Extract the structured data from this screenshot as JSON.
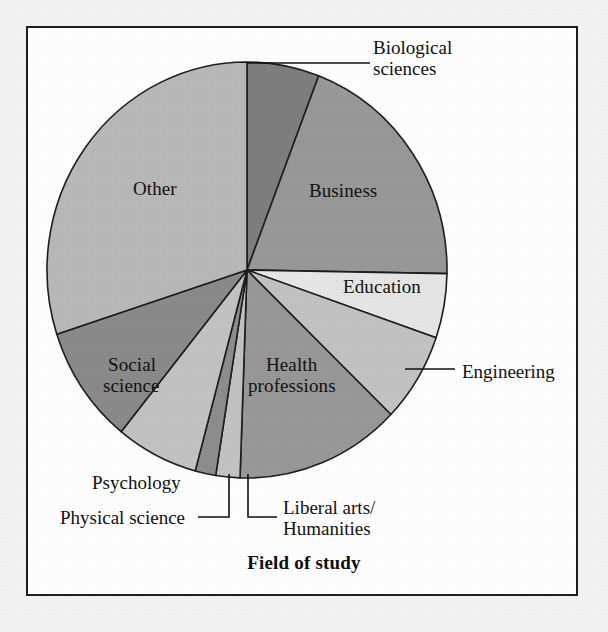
{
  "figure": {
    "title": "Field of study",
    "frame": {
      "border_color": "#1d1d1d",
      "background": "#ffffff"
    },
    "page_background": "#f3f3f1"
  },
  "chart_data": {
    "type": "pie",
    "title": "Field of study",
    "xlabel": "",
    "ylabel": "",
    "legend_position": "none",
    "grid": false,
    "start_angle_deg": 0,
    "direction": "clockwise",
    "center": {
      "x": 247,
      "y": 270
    },
    "radius": {
      "rx": 200,
      "ry": 208
    },
    "categories": [
      "Biological sciences",
      "Business",
      "Education",
      "Engineering",
      "Health professions",
      "Liberal arts/ Humanities",
      "Physical science",
      "Psychology",
      "Social science",
      "Other"
    ],
    "values": [
      5.8,
      19.4,
      5.0,
      6.9,
      13.3,
      1.9,
      1.7,
      6.7,
      9.2,
      30.1
    ],
    "angles_deg": [
      21.0,
      70.0,
      18.0,
      25.0,
      48.0,
      7.0,
      6.0,
      24.0,
      33.0,
      108.0
    ],
    "slices": [
      {
        "label": "Biological sciences",
        "start_deg": 0,
        "end_deg": 21,
        "value": 5.8,
        "color": "#7e7e7e"
      },
      {
        "label": "Business",
        "start_deg": 21,
        "end_deg": 91,
        "value": 19.4,
        "color": "#989898"
      },
      {
        "label": "Education",
        "start_deg": 91,
        "end_deg": 109,
        "value": 5.0,
        "color": "#e6e6e6"
      },
      {
        "label": "Engineering",
        "start_deg": 109,
        "end_deg": 134,
        "value": 6.9,
        "color": "#c2c2c2"
      },
      {
        "label": "Health professions",
        "start_deg": 134,
        "end_deg": 182,
        "value": 13.3,
        "color": "#989898"
      },
      {
        "label": "Liberal arts/ Humanities",
        "start_deg": 182,
        "end_deg": 189,
        "value": 1.9,
        "color": "#c2c2c2"
      },
      {
        "label": "Physical science",
        "start_deg": 189,
        "end_deg": 195,
        "value": 1.7,
        "color": "#8d8d8d"
      },
      {
        "label": "Psychology",
        "start_deg": 195,
        "end_deg": 219,
        "value": 6.7,
        "color": "#c2c2c2"
      },
      {
        "label": "Social science",
        "start_deg": 219,
        "end_deg": 252,
        "value": 9.2,
        "color": "#8a8a8a"
      },
      {
        "label": "Other",
        "start_deg": 252,
        "end_deg": 360,
        "value": 30.1,
        "color": "#b8b8b8"
      }
    ],
    "stroke_color": "#1d1d1d",
    "stroke_width": 1.6
  },
  "labels": {
    "inside": [
      {
        "name": "business",
        "text": "Business",
        "x": 309,
        "y": 181
      },
      {
        "name": "education",
        "text": "Education",
        "x": 343,
        "y": 277
      },
      {
        "name": "other",
        "text": "Other",
        "x": 133,
        "y": 179
      },
      {
        "name": "social-science-l1",
        "text": "Social",
        "x": 108,
        "y": 355
      },
      {
        "name": "social-science-l2",
        "text": "science",
        "x": 103,
        "y": 376
      },
      {
        "name": "health-l1",
        "text": "Health",
        "x": 266,
        "y": 355
      },
      {
        "name": "health-l2",
        "text": "professions",
        "x": 248,
        "y": 376
      }
    ],
    "outside": [
      {
        "name": "biological-sciences-l1",
        "text": "Biological",
        "x": 373,
        "y": 38
      },
      {
        "name": "biological-sciences-l2",
        "text": "sciences",
        "x": 373,
        "y": 59
      },
      {
        "name": "engineering",
        "text": "Engineering",
        "x": 462,
        "y": 362
      },
      {
        "name": "psychology",
        "text": "Psychology",
        "x": 92,
        "y": 473
      },
      {
        "name": "physical-science",
        "text": "Physical science",
        "x": 60,
        "y": 508
      },
      {
        "name": "liberal-arts-l1",
        "text": "Liberal arts/",
        "x": 283,
        "y": 498
      },
      {
        "name": "liberal-arts-l2",
        "text": "Humanities",
        "x": 283,
        "y": 519
      }
    ]
  },
  "leader_lines": [
    {
      "name": "leader-biological-sciences",
      "points": "247,63 370,63"
    },
    {
      "name": "leader-engineering",
      "points": "405,369 455,369"
    },
    {
      "name": "leader-physical-science",
      "points": "229,474 229,517 198,517"
    },
    {
      "name": "leader-liberal-arts",
      "points": "248,474 248,517 277,517"
    }
  ]
}
